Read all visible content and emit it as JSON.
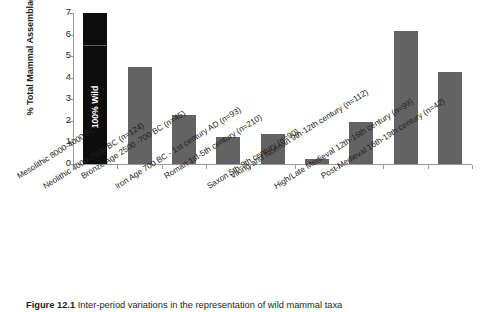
{
  "figure": {
    "caption_label": "Figure 12.1",
    "caption_text": " Inter-period variations in the representation of wild mammal taxa"
  },
  "chart_data": {
    "type": "bar",
    "title": "",
    "xlabel": "",
    "ylabel": "% Total Mammal Assemblage",
    "ylim": [
      0,
      7
    ],
    "yticks": [
      0,
      1,
      2,
      3,
      4,
      5,
      6,
      7
    ],
    "ytick_labels": [
      "0",
      "1",
      "2",
      "3",
      "4",
      "5",
      "6",
      "7"
    ],
    "grid": false,
    "legend": "none",
    "bar_color": "#636363",
    "highlight_color": "#0d0d0d",
    "categories": [
      "Mesolithic 8000-4000 BC",
      "Neolithic 4000-2500 BC (n=124)",
      "Bronze Age 2500 -700 BC (n=45)",
      "Iron Age 700 BC - 1st century AD (n=93)",
      "Roman 1st-5th century (n=210)",
      "Saxon 5th-9th century (n=90)",
      "Viking and Norman 9th-12th century (n=112)",
      "High/Late Medieval 12th-16th century (n=99)",
      "Post-Medieval 16th-19th century (n=42)"
    ],
    "values": [
      7.0,
      4.5,
      2.28,
      1.27,
      1.38,
      0.25,
      1.97,
      6.15,
      4.25
    ],
    "annotations": [
      {
        "category_index": 0,
        "text": "100% Wild",
        "divider_value": 5.47,
        "note": "First bar is clipped at axis maximum; black fill denotes 100% wild assemblage"
      }
    ]
  }
}
